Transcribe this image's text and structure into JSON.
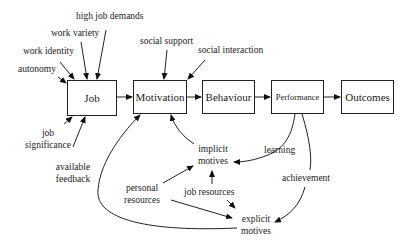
{
  "diagram": {
    "boxes": {
      "job": "Job",
      "motivation": "Motivation",
      "behaviour": "Behaviour",
      "performance": "Performance",
      "outcomes": "Outcomes"
    },
    "job_inputs": {
      "high_job_demands": "high job demands",
      "work_variety": "work variety",
      "work_identity": "work identity",
      "autonomy": "autonomy",
      "job_significance_1": "job",
      "job_significance_2": "significance",
      "available_feedback_1": "available",
      "available_feedback_2": "feedback"
    },
    "motivation_inputs": {
      "social_support": "social support",
      "social_interaction": "social interaction"
    },
    "motives": {
      "implicit_1": "implicit",
      "implicit_2": "motives",
      "explicit_1": "explicit",
      "explicit_2": "motives"
    },
    "resources": {
      "personal_1": "personal",
      "personal_2": "resources",
      "job_resources": "job resources"
    },
    "feedback_paths": {
      "learning": "learning",
      "achievement": "achievement"
    }
  }
}
